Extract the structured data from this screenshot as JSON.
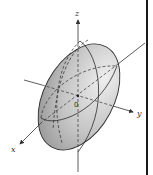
{
  "diagram": {
    "axes": {
      "x_label": "x",
      "y_label": "y",
      "z_label": "z",
      "origin_label": "0"
    },
    "colors": {
      "surface_light": "#e4e4e4",
      "surface_dark": "#8f8f8f",
      "outline": "#2b2b2b",
      "axis": "#333333",
      "border": "#1a1a1a"
    }
  }
}
